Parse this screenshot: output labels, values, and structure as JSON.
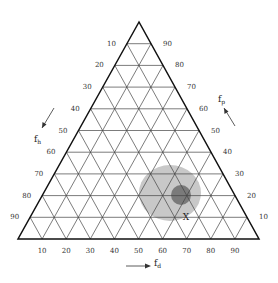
{
  "diagram": {
    "type": "ternary",
    "geometry": {
      "apex": [
        139,
        22
      ],
      "bottom_left": [
        18,
        239
      ],
      "bottom_right": [
        259,
        239
      ],
      "divisions": 10
    },
    "colors": {
      "outline": "#111111",
      "grid": "#444444",
      "light_region": "#c8c8c8",
      "dark_region": "#7a7a7a",
      "text": "#333333"
    },
    "axes": {
      "left": {
        "name": "f_h",
        "label_main": "f",
        "label_sub": "h",
        "ticks": [
          "10",
          "20",
          "30",
          "40",
          "50",
          "60",
          "70",
          "80",
          "90"
        ],
        "arrow_direction": "down-left"
      },
      "right": {
        "name": "f_p",
        "label_main": "f",
        "label_sub": "p",
        "ticks": [
          "90",
          "80",
          "70",
          "60",
          "50",
          "40",
          "30",
          "20",
          "10"
        ],
        "arrow_direction": "up-left"
      },
      "bottom": {
        "name": "f_d",
        "label_main": "f",
        "label_sub": "d",
        "ticks": [
          "10",
          "20",
          "30",
          "40",
          "50",
          "60",
          "70",
          "80",
          "90"
        ],
        "arrow_direction": "right"
      }
    },
    "regions": [
      {
        "name": "light-region",
        "cx": 170,
        "cy": 193,
        "rx": 31,
        "ry": 28
      },
      {
        "name": "dark-region",
        "cx": 181,
        "cy": 195,
        "rx": 10,
        "ry": 10
      }
    ],
    "marker": {
      "label": "X",
      "x": 186,
      "y": 217
    }
  }
}
